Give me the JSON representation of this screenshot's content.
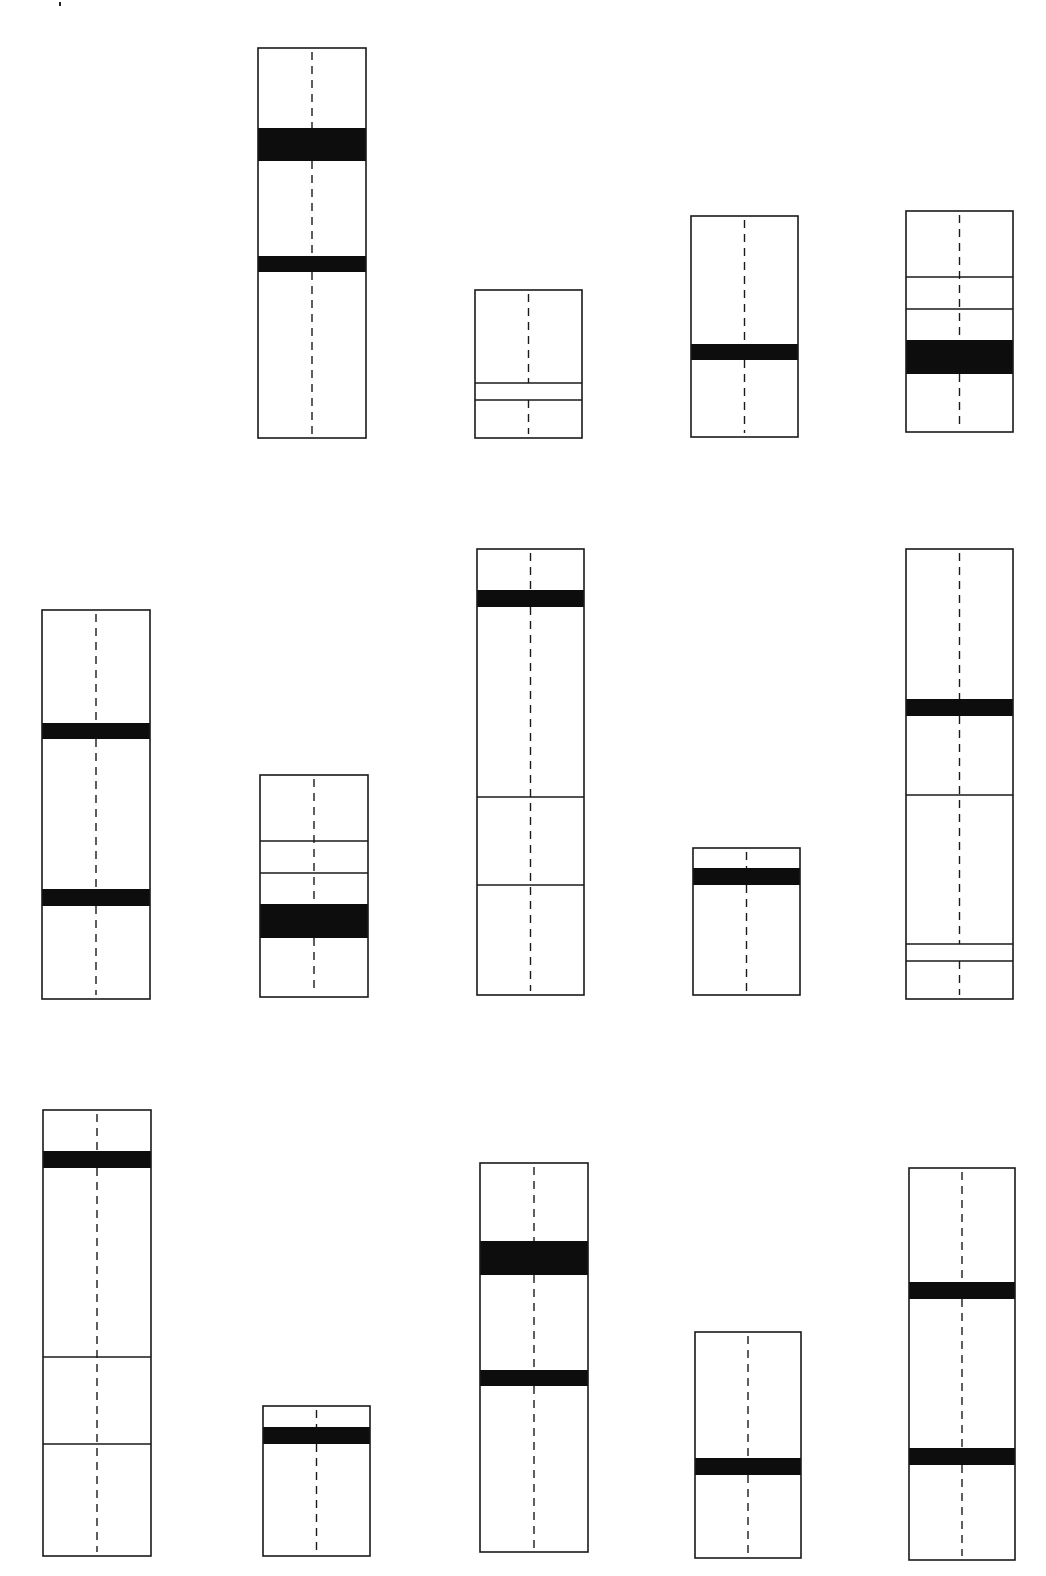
{
  "canvas": {
    "width": 1046,
    "height": 1576,
    "background": "#ffffff"
  },
  "colors": {
    "stroke": "#1a1a1a",
    "band": "#0d0d0d",
    "fill": "#ffffff"
  },
  "style": {
    "dash_length": 8,
    "dash_gap": 6,
    "outline_width": 1.6,
    "thin_line_width": 1.4
  },
  "artifacts": [
    {
      "name": "speck-mark",
      "x": 59,
      "y": 2
    }
  ],
  "figures": [
    {
      "id": "A",
      "row": 1,
      "col": 2,
      "x": 258,
      "y": 48,
      "w": 108,
      "h": 390,
      "bands": [
        {
          "y0": 128,
          "y1": 161
        },
        {
          "y0": 256,
          "y1": 272
        }
      ],
      "lines": []
    },
    {
      "id": "B",
      "row": 1,
      "col": 3,
      "x": 475,
      "y": 290,
      "w": 107,
      "h": 148,
      "bands": [],
      "lines": [
        383,
        400
      ]
    },
    {
      "id": "C",
      "row": 1,
      "col": 4,
      "x": 691,
      "y": 216,
      "w": 107,
      "h": 221,
      "bands": [
        {
          "y0": 344,
          "y1": 360
        }
      ],
      "lines": []
    },
    {
      "id": "D",
      "row": 1,
      "col": 5,
      "x": 906,
      "y": 211,
      "w": 107,
      "h": 221,
      "bands": [
        {
          "y0": 340,
          "y1": 374
        }
      ],
      "lines": [
        277,
        309
      ]
    },
    {
      "id": "E",
      "row": 2,
      "col": 1,
      "x": 42,
      "y": 610,
      "w": 108,
      "h": 389,
      "bands": [
        {
          "y0": 723,
          "y1": 739
        },
        {
          "y0": 889,
          "y1": 906
        }
      ],
      "lines": []
    },
    {
      "id": "F",
      "row": 2,
      "col": 2,
      "x": 260,
      "y": 775,
      "w": 108,
      "h": 222,
      "bands": [
        {
          "y0": 904,
          "y1": 938
        }
      ],
      "lines": [
        841,
        873
      ]
    },
    {
      "id": "G",
      "row": 2,
      "col": 3,
      "x": 477,
      "y": 549,
      "w": 107,
      "h": 446,
      "bands": [
        {
          "y0": 590,
          "y1": 607
        }
      ],
      "lines": [
        797,
        885
      ]
    },
    {
      "id": "H",
      "row": 2,
      "col": 4,
      "x": 693,
      "y": 848,
      "w": 107,
      "h": 147,
      "bands": [
        {
          "y0": 868,
          "y1": 885
        }
      ],
      "lines": []
    },
    {
      "id": "I",
      "row": 2,
      "col": 5,
      "x": 906,
      "y": 549,
      "w": 107,
      "h": 450,
      "bands": [
        {
          "y0": 699,
          "y1": 716
        }
      ],
      "lines": [
        795,
        944,
        961
      ]
    },
    {
      "id": "J",
      "row": 3,
      "col": 1,
      "x": 43,
      "y": 1110,
      "w": 108,
      "h": 446,
      "bands": [
        {
          "y0": 1151,
          "y1": 1168
        }
      ],
      "lines": [
        1357,
        1444
      ]
    },
    {
      "id": "K",
      "row": 3,
      "col": 2,
      "x": 263,
      "y": 1406,
      "w": 107,
      "h": 150,
      "bands": [
        {
          "y0": 1427,
          "y1": 1444
        }
      ],
      "lines": []
    },
    {
      "id": "L",
      "row": 3,
      "col": 3,
      "x": 480,
      "y": 1163,
      "w": 108,
      "h": 389,
      "bands": [
        {
          "y0": 1241,
          "y1": 1275
        },
        {
          "y0": 1370,
          "y1": 1386
        }
      ],
      "lines": []
    },
    {
      "id": "M",
      "row": 3,
      "col": 4,
      "x": 695,
      "y": 1332,
      "w": 106,
      "h": 226,
      "bands": [
        {
          "y0": 1458,
          "y1": 1475
        }
      ],
      "lines": []
    },
    {
      "id": "N",
      "row": 3,
      "col": 5,
      "x": 909,
      "y": 1168,
      "w": 106,
      "h": 392,
      "bands": [
        {
          "y0": 1282,
          "y1": 1299
        },
        {
          "y0": 1448,
          "y1": 1465
        }
      ],
      "lines": []
    }
  ]
}
